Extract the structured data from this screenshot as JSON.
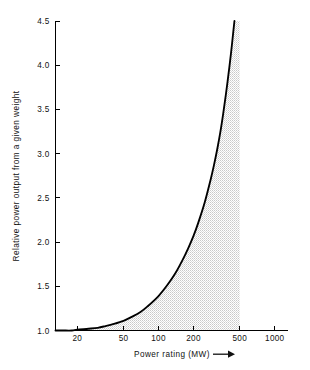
{
  "chart_data": {
    "type": "line",
    "title": "",
    "subtitle": "",
    "xlabel": "Power rating (MW)",
    "xlabel_suffix_icon": "right-arrow",
    "ylabel": "Relative power output from a given weight",
    "xscale": "log",
    "yscale": "linear",
    "xlim": [
      13,
      1300
    ],
    "ylim": [
      1.0,
      4.5
    ],
    "grid": false,
    "legend": null,
    "xtick_labels": [
      "20",
      "50",
      "100",
      "200",
      "500",
      "1000"
    ],
    "xtick_values": [
      20,
      50,
      100,
      200,
      500,
      1000
    ],
    "ytick_labels": [
      "1.0",
      "1.5",
      "2.0",
      "2.5",
      "3.0",
      "3.5",
      "4.0",
      "4.5"
    ],
    "ytick_values": [
      1.0,
      1.5,
      2.0,
      2.5,
      3.0,
      3.5,
      4.0,
      4.5
    ],
    "series": [
      {
        "name": "Relative power output",
        "x": [
          13,
          15,
          18,
          20,
          25,
          30,
          35,
          40,
          50,
          60,
          70,
          80,
          100,
          120,
          140,
          160,
          180,
          200,
          220,
          250,
          280,
          300,
          320,
          340,
          360,
          380,
          400,
          420,
          440,
          450
        ],
        "values": [
          1.0,
          1.0,
          1.0,
          1.01,
          1.02,
          1.03,
          1.05,
          1.07,
          1.11,
          1.16,
          1.21,
          1.27,
          1.39,
          1.52,
          1.65,
          1.79,
          1.93,
          2.07,
          2.22,
          2.45,
          2.7,
          2.87,
          3.05,
          3.24,
          3.45,
          3.67,
          3.9,
          4.13,
          4.38,
          4.5
        ]
      }
    ],
    "shaded_region": {
      "description": "area between curve and baseline y=1.0, bounded right at x=500",
      "fill_color": "#e8e8e8",
      "pattern": "stipple",
      "x_start": 13,
      "x_end": 500,
      "y_baseline": 1.0
    },
    "annotations": []
  },
  "axis": {
    "line_color": "#000000"
  }
}
